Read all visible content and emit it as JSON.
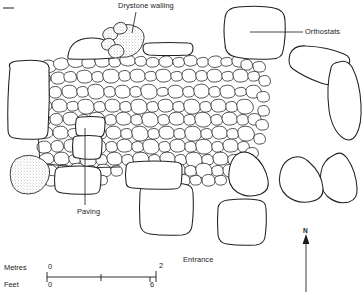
{
  "figure": {
    "kind": "archaeological-site-plan"
  },
  "labels": {
    "drystone_walling": "Drystone walling",
    "orthostats": "Orthostats",
    "paving": "Paving",
    "entrance": "Entrance"
  },
  "north_arrow": {
    "letter": "N"
  },
  "scale": {
    "metres_label": "Metres",
    "feet_label": "Feet",
    "metres_start": "0",
    "metres_end": "2",
    "feet_start": "0",
    "feet_end": "6"
  },
  "colors": {
    "ink": "#1a1a1a",
    "line": "#202020",
    "paper": "#ffffff",
    "stipple": "#8a8a8a"
  }
}
